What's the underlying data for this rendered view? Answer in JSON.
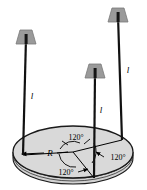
{
  "figure": {
    "type": "physics-diagram",
    "colors": {
      "background": "#ffffff",
      "disk_fill": "#d9d9d9",
      "disk_edge": "#1a1a1a",
      "mass_fill": "#9a9a9a",
      "mass_edge": "#6e6e6e",
      "string": "#111111",
      "text": "#000000"
    },
    "disk": {
      "name": "disk",
      "center_x": 73,
      "center_y": 152,
      "radius_x": 60,
      "radius_y": 26,
      "thickness": 6,
      "radius_label": "R"
    },
    "strings": [
      {
        "id": "left",
        "label": "l",
        "top_x": 26,
        "top_y": 38,
        "bottom_x": 23,
        "bottom_y": 155
      },
      {
        "id": "middle",
        "label": "l",
        "top_x": 95,
        "top_y": 72,
        "bottom_x": 94,
        "bottom_y": 178
      },
      {
        "id": "right",
        "label": "l",
        "top_x": 118,
        "top_y": 16,
        "bottom_x": 122,
        "bottom_y": 134
      }
    ],
    "masses": [
      {
        "id": "left",
        "cx": 26,
        "cy": 38
      },
      {
        "id": "middle",
        "cx": 95,
        "cy": 72
      },
      {
        "id": "right",
        "cx": 118,
        "cy": 16
      }
    ],
    "angles": [
      {
        "id": "upper-left",
        "value": "120°"
      },
      {
        "id": "lower-left",
        "value": "120°"
      },
      {
        "id": "right",
        "value": "120°"
      }
    ],
    "labels": {
      "length": "l",
      "radius": "R",
      "angle": "120°"
    }
  }
}
